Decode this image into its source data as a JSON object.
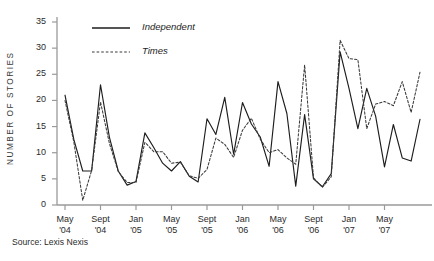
{
  "chart_data": {
    "type": "line",
    "title": "",
    "xlabel": "",
    "ylabel": "NUMBER OF STORIES",
    "ylim": [
      0,
      35
    ],
    "yticks": [
      0,
      5,
      10,
      15,
      20,
      25,
      30,
      35
    ],
    "grid": false,
    "legend_position": "top-left-inside",
    "x_tick_labels": [
      {
        "month": "May",
        "year": "'04"
      },
      {
        "month": "Sept",
        "year": "'04"
      },
      {
        "month": "Jan",
        "year": "'05"
      },
      {
        "month": "May",
        "year": "'05"
      },
      {
        "month": "Sept",
        "year": "'05"
      },
      {
        "month": "Jan",
        "year": "'06"
      },
      {
        "month": "May",
        "year": "'06"
      },
      {
        "month": "Sept",
        "year": "'06"
      },
      {
        "month": "Jan",
        "year": "'07"
      },
      {
        "month": "May",
        "year": "'07"
      }
    ],
    "x": [
      "May '04",
      "Jun '04",
      "Jul '04",
      "Aug '04",
      "Sept '04",
      "Oct '04",
      "Nov '04",
      "Dec '04",
      "Jan '05",
      "Feb '05",
      "Mar '05",
      "Apr '05",
      "May '05",
      "Jun '05",
      "Jul '05",
      "Aug '05",
      "Sept '05",
      "Oct '05",
      "Nov '05",
      "Dec '05",
      "Jan '06",
      "Feb '06",
      "Mar '06",
      "Apr '06",
      "May '06",
      "Jun '06",
      "Jul '06",
      "Aug '06",
      "Sept '06",
      "Oct '06",
      "Nov '06",
      "Dec '06",
      "Jan '07",
      "Feb '07",
      "Mar '07",
      "Apr '07",
      "May '07",
      "Jun '07",
      "Jul '07",
      "Aug '07",
      "Sept '07"
    ],
    "series": [
      {
        "name": "Independent",
        "style": "solid",
        "color": "#1d1d1d",
        "values": [
          21,
          12.5,
          6.5,
          6.5,
          23,
          13,
          6.5,
          3.8,
          4.5,
          13.8,
          11,
          8,
          6.5,
          8.3,
          5.5,
          4.4,
          16.5,
          13.5,
          20.6,
          9.7,
          19.6,
          15.5,
          13,
          7.4,
          23.6,
          17.5,
          3.6,
          17.3,
          5,
          3.5,
          6,
          29.3,
          22.3,
          14.6,
          22.3,
          17,
          7.3,
          15.4,
          9,
          8.4,
          16.4
        ]
      },
      {
        "name": "Times",
        "style": "dashed",
        "color": "#3a3a3a",
        "values": [
          20,
          12,
          0.9,
          6.6,
          19.7,
          11.8,
          6.4,
          4.3,
          4.3,
          12,
          10.2,
          10.2,
          8,
          8.2,
          5.6,
          5.1,
          6.8,
          12.8,
          11.6,
          9.1,
          14.3,
          16.6,
          12.6,
          10,
          10.6,
          9,
          7.8,
          26.8,
          5.2,
          3.4,
          5.4,
          31.5,
          28,
          27.8,
          14.6,
          19.3,
          19.8,
          19,
          23.6,
          17.7,
          25.4
        ]
      }
    ]
  },
  "legend": {
    "items": [
      {
        "label": "Independent",
        "style": "solid"
      },
      {
        "label": "Times",
        "style": "dashed"
      }
    ]
  },
  "source": {
    "text": "Source: Lexis Nexis"
  },
  "colors": {
    "axis": "#9a9a9a",
    "independent": "#1d1d1d",
    "times": "#3a3a3a",
    "text": "#2b2b2b"
  }
}
